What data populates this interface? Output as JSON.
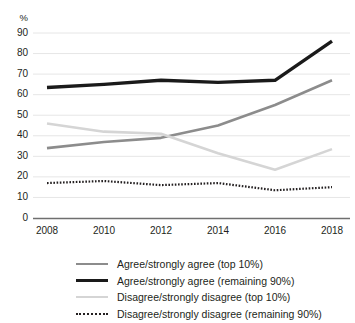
{
  "axes": {
    "y_unit_label": "%",
    "y_ticks": [
      "90",
      "80",
      "70",
      "60",
      "50",
      "40",
      "30",
      "20",
      "10",
      "0"
    ],
    "x_ticks": [
      "2008",
      "2010",
      "2012",
      "2014",
      "2016",
      "2018"
    ]
  },
  "legend": {
    "items": [
      {
        "label": "Agree/strongly agree (top 10%)",
        "style": "solid-gray",
        "color": "#8c8c8c"
      },
      {
        "label": "Agree/strongly agree (remaining 90%)",
        "style": "solid-black-thick",
        "color": "#1a1a1a"
      },
      {
        "label": "Disagree/strongly disagree (top 10%)",
        "style": "solid-light-gray",
        "color": "#d5d5d5"
      },
      {
        "label": "Disagree/strongly disagree (remaining 90%)",
        "style": "dotted-black",
        "color": "#231f20"
      }
    ]
  },
  "chart_data": {
    "type": "line",
    "title": "",
    "subtitle": "",
    "xlabel": "",
    "ylabel": "%",
    "x": [
      2008,
      2010,
      2012,
      2014,
      2016,
      2018
    ],
    "xlim": [
      2008,
      2018
    ],
    "ylim": [
      0,
      90
    ],
    "y_tick_values": [
      0,
      10,
      20,
      30,
      40,
      50,
      60,
      70,
      80,
      90
    ],
    "x_tick_values": [
      2008,
      2010,
      2012,
      2014,
      2016,
      2018
    ],
    "grid": "horizontal",
    "legend_position": "bottom",
    "series": [
      {
        "name": "Agree/strongly agree (top 10%)",
        "color": "#8c8c8c",
        "style": "solid",
        "width": 2.6,
        "values": [
          34,
          37,
          39,
          45,
          55,
          67
        ]
      },
      {
        "name": "Agree/strongly agree (remaining 90%)",
        "color": "#1a1a1a",
        "style": "solid",
        "width": 3.4,
        "values": [
          63.5,
          65,
          67,
          66,
          67,
          86
        ]
      },
      {
        "name": "Disagree/strongly disagree (top 10%)",
        "color": "#d5d5d5",
        "style": "solid",
        "width": 2.6,
        "values": [
          46,
          42,
          41,
          31.5,
          23.5,
          33.5
        ]
      },
      {
        "name": "Disagree/strongly disagree (remaining 90%)",
        "color": "#231f20",
        "style": "dotted",
        "width": 2.2,
        "values": [
          17,
          18,
          16,
          17,
          13.5,
          15
        ]
      }
    ]
  }
}
